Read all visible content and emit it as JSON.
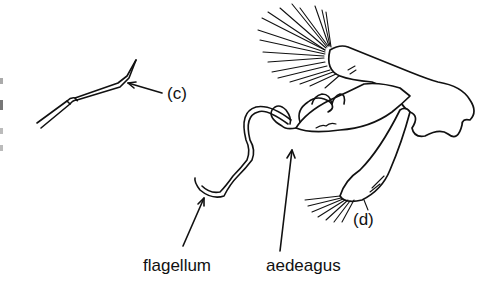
{
  "figure": {
    "panels": [
      {
        "id": "c",
        "label": "(c)"
      },
      {
        "id": "d",
        "label": "(d)"
      }
    ],
    "annotations": [
      {
        "id": "flagellum",
        "label": "flagellum"
      },
      {
        "id": "aedeagus",
        "label": "aedeagus"
      }
    ],
    "colors": {
      "ink": "#111111",
      "background": "#ffffff"
    }
  }
}
